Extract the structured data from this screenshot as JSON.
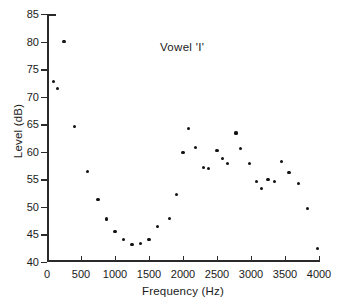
{
  "chart_data": {
    "type": "scatter",
    "title": "",
    "annotation": "Vowel 'I'",
    "xlabel": "Frequency (Hz)",
    "ylabel": "Level (dB)",
    "xlim": [
      0,
      4000
    ],
    "ylim": [
      40,
      85
    ],
    "xticks": [
      0,
      500,
      1000,
      1500,
      2000,
      2500,
      3000,
      3500,
      4000
    ],
    "xtick_labels": [
      "0",
      "500",
      "1000",
      "1500",
      "2000",
      "2500",
      "3000",
      "3500",
      "4000"
    ],
    "yticks": [
      40,
      45,
      50,
      55,
      60,
      65,
      70,
      75,
      80,
      85
    ],
    "ytick_labels": [
      "40",
      "45",
      "50",
      "55",
      "60",
      "65",
      "70",
      "75",
      "80",
      "85"
    ],
    "grid": false,
    "legend": false,
    "marker_color": "#111111",
    "axis_color": "#2a2a2a",
    "background_color": "#ffffff",
    "series": [
      {
        "name": "spectral-level",
        "points": [
          [
            100,
            72.7
          ],
          [
            160,
            71.5
          ],
          [
            250,
            80.0
          ],
          [
            400,
            64.6
          ],
          [
            600,
            56.4
          ],
          [
            750,
            51.3
          ],
          [
            870,
            47.8
          ],
          [
            1000,
            45.5
          ],
          [
            1120,
            44.1
          ],
          [
            1250,
            43.2
          ],
          [
            1370,
            43.3
          ],
          [
            1500,
            44.1
          ],
          [
            1630,
            46.5
          ],
          [
            1800,
            47.9
          ],
          [
            1900,
            52.2
          ],
          [
            2000,
            59.8
          ],
          [
            2080,
            64.2
          ],
          [
            2180,
            60.8
          ],
          [
            2300,
            57.2
          ],
          [
            2380,
            57.0
          ],
          [
            2500,
            60.2
          ],
          [
            2580,
            58.8
          ],
          [
            2650,
            57.8
          ],
          [
            2780,
            63.4
          ],
          [
            2850,
            60.6
          ],
          [
            2980,
            57.8
          ],
          [
            3080,
            54.6
          ],
          [
            3150,
            53.3
          ],
          [
            3250,
            55.0
          ],
          [
            3350,
            54.6
          ],
          [
            3450,
            58.3
          ],
          [
            3560,
            56.2
          ],
          [
            3700,
            54.3
          ],
          [
            3830,
            49.7
          ],
          [
            3980,
            42.5
          ]
        ]
      }
    ]
  }
}
